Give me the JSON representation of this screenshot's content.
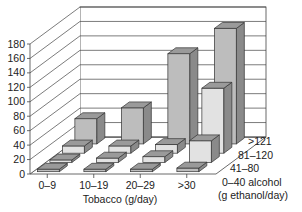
{
  "chart_data": {
    "type": "bar",
    "subtype": "3d-grouped",
    "title": "",
    "xlabel": "Tobacco (g/day)",
    "ylabel": "",
    "zlabel": "alcohol (g ethanol/day)",
    "ylim": [
      0,
      180
    ],
    "yticks": [
      0,
      20,
      40,
      60,
      80,
      100,
      120,
      140,
      160,
      180
    ],
    "categories": [
      "0–9",
      "10–19",
      "20–29",
      ">30"
    ],
    "series": [
      {
        "name": "0–40",
        "values": [
          1,
          3,
          1,
          5
        ]
      },
      {
        "name": "41–80",
        "values": [
          3,
          6,
          8,
          30
        ]
      },
      {
        "name": "81–120",
        "values": [
          10,
          10,
          12,
          90
        ]
      },
      {
        "name": ">121",
        "values": [
          35,
          50,
          125,
          160
        ]
      }
    ],
    "grid": true,
    "legend": "depth-axis labels on right"
  },
  "labels": {
    "x_title": "Tobacco (g/day)",
    "depth_labels": [
      ">121",
      "81–120",
      "41–80",
      "0–40 alcohol"
    ],
    "depth_title": "(g ethanol/day)"
  },
  "colors": {
    "face": "#bdbdbd",
    "top": "#9a9a9a",
    "side": "#8a8a8a",
    "light_face": "#e2e2e2",
    "grid": "#444444"
  }
}
